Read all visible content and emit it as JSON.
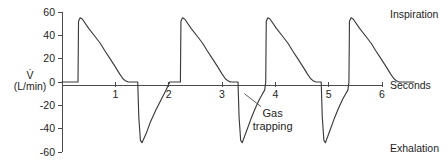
{
  "chart_data": {
    "type": "line",
    "title": "",
    "subtitle": "",
    "xlabel": "Seconds",
    "ylabel": "V̇ (L/min)",
    "ylabel_symbol": "V̇",
    "ylabel_units": "(L/min)",
    "xlim": [
      0,
      6
    ],
    "ylim": [
      -60,
      60
    ],
    "grid": false,
    "legend_position": "none",
    "x_ticks": [
      1,
      2,
      3,
      4,
      5,
      6
    ],
    "x_tick_labels": [
      "1",
      "2",
      "3",
      "4",
      "5",
      "6"
    ],
    "y_ticks": [
      60,
      40,
      20,
      0,
      -20,
      -40,
      -60
    ],
    "y_tick_labels": [
      "60",
      "40",
      "20",
      "0",
      "-20",
      "-40",
      "-60"
    ],
    "zero_line": 0,
    "series": [
      {
        "name": "Flow",
        "color": "#3c3c3c",
        "points": [
          [
            0.0,
            0
          ],
          [
            0.3,
            0
          ],
          [
            0.31,
            52
          ],
          [
            0.34,
            55
          ],
          [
            0.38,
            54
          ],
          [
            0.5,
            46
          ],
          [
            0.62,
            39
          ],
          [
            0.72,
            33
          ],
          [
            0.8,
            27
          ],
          [
            0.9,
            20
          ],
          [
            1.0,
            13
          ],
          [
            1.08,
            7
          ],
          [
            1.14,
            3
          ],
          [
            1.19,
            1
          ],
          [
            1.24,
            0
          ],
          [
            1.42,
            0
          ],
          [
            1.44,
            -30
          ],
          [
            1.47,
            -50
          ],
          [
            1.5,
            -52
          ],
          [
            1.58,
            -44
          ],
          [
            1.66,
            -34
          ],
          [
            1.76,
            -24
          ],
          [
            1.86,
            -15
          ],
          [
            1.94,
            -8
          ],
          [
            1.99,
            -3
          ],
          [
            2.02,
            0
          ],
          [
            2.22,
            0
          ],
          [
            2.23,
            52
          ],
          [
            2.26,
            55
          ],
          [
            2.3,
            54
          ],
          [
            2.42,
            46
          ],
          [
            2.54,
            39
          ],
          [
            2.64,
            33
          ],
          [
            2.72,
            27
          ],
          [
            2.82,
            20
          ],
          [
            2.92,
            13
          ],
          [
            3.0,
            7
          ],
          [
            3.06,
            3
          ],
          [
            3.11,
            1
          ],
          [
            3.16,
            0
          ],
          [
            3.3,
            0
          ],
          [
            3.32,
            -30
          ],
          [
            3.35,
            -50
          ],
          [
            3.38,
            -52
          ],
          [
            3.46,
            -42
          ],
          [
            3.54,
            -32
          ],
          [
            3.62,
            -23
          ],
          [
            3.7,
            -15
          ],
          [
            3.76,
            -10
          ],
          [
            3.8,
            -7
          ],
          [
            3.82,
            0
          ],
          [
            3.83,
            52
          ],
          [
            3.86,
            55
          ],
          [
            3.9,
            54
          ],
          [
            4.02,
            46
          ],
          [
            4.14,
            39
          ],
          [
            4.24,
            33
          ],
          [
            4.32,
            27
          ],
          [
            4.42,
            20
          ],
          [
            4.52,
            13
          ],
          [
            4.6,
            7
          ],
          [
            4.66,
            3
          ],
          [
            4.71,
            1
          ],
          [
            4.76,
            0
          ],
          [
            4.86,
            0
          ],
          [
            4.88,
            -30
          ],
          [
            4.91,
            -50
          ],
          [
            4.94,
            -52
          ],
          [
            5.02,
            -42
          ],
          [
            5.1,
            -32
          ],
          [
            5.18,
            -23
          ],
          [
            5.26,
            -15
          ],
          [
            5.32,
            -10
          ],
          [
            5.36,
            -7
          ],
          [
            5.38,
            0
          ],
          [
            5.39,
            52
          ],
          [
            5.42,
            55
          ],
          [
            5.46,
            54
          ],
          [
            5.58,
            46
          ],
          [
            5.7,
            39
          ],
          [
            5.8,
            33
          ],
          [
            5.88,
            27
          ],
          [
            5.98,
            20
          ],
          [
            6.08,
            13
          ],
          [
            6.16,
            7
          ],
          [
            6.22,
            3
          ],
          [
            6.27,
            1
          ],
          [
            6.32,
            0
          ],
          [
            6.6,
            0
          ]
        ]
      }
    ],
    "annotations": [
      {
        "name": "gas-trapping",
        "text_line_1": "Gas",
        "text_line_2": "trapping",
        "text_x": 3.95,
        "text_y": -30,
        "pointer_from_x": 3.73,
        "pointer_from_y": -21,
        "pointer_to_x": 3.42,
        "pointer_to_y": -10
      }
    ]
  },
  "labels": {
    "inspiration": "Inspiration",
    "exhalation": "Exhalation",
    "seconds": "Seconds"
  },
  "colors": {
    "trace": "#3c3c3c",
    "axis": "#4b4b4b",
    "text": "#1d1d1d",
    "background": "#ffffff"
  }
}
